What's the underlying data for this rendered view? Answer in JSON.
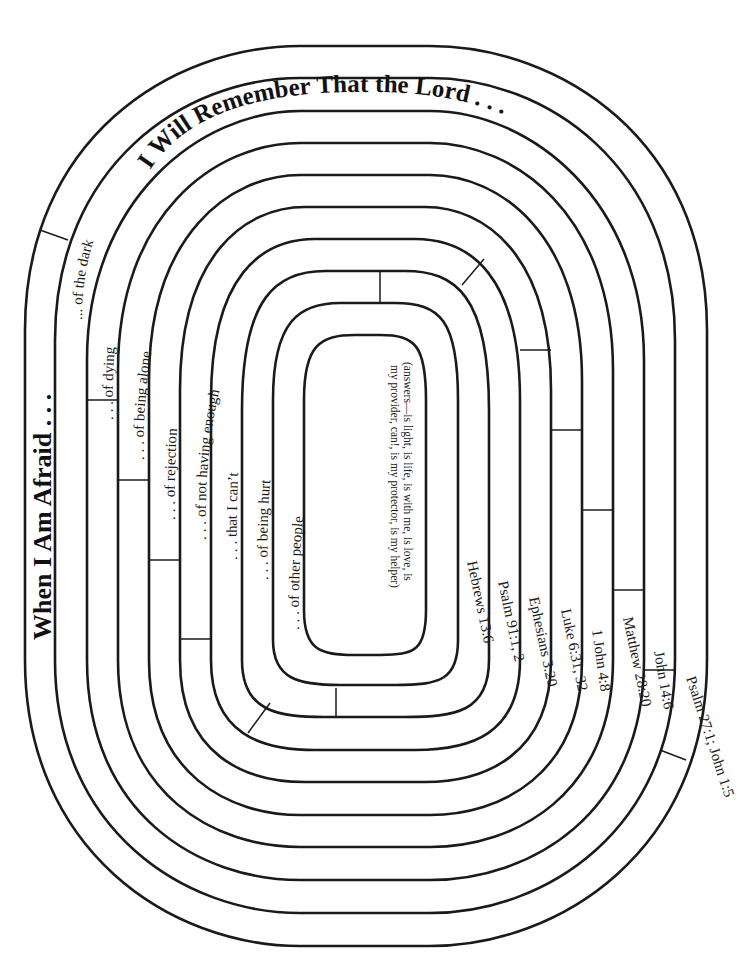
{
  "titles": {
    "left": "When I Am Afraid . . .",
    "top": "I Will Remember That the Lord . . ."
  },
  "fears": [
    "... of the dark",
    ". . . of dying",
    ". . . of being alone",
    ". . . of rejection",
    ". . . of not having enough",
    ". . . that I can’t",
    ". . . of being hurt",
    ". . . of other people"
  ],
  "references": [
    "Psalm 27:1; John 1:5",
    "John 14:6",
    "Matthew 28:20",
    "1 John 4:8",
    "Luke 6:31, 32",
    "Ephesians 3:20",
    "Psalm 91:1, 2",
    "Hebrews 13:6"
  ],
  "answers": {
    "line1": "(answers—is light, is life, is with me, is love, is",
    "line2": "my provider, can!, is my protector, is my helper)"
  },
  "colors": {
    "ink": "#1a1a1a",
    "paper": "#ffffff"
  }
}
